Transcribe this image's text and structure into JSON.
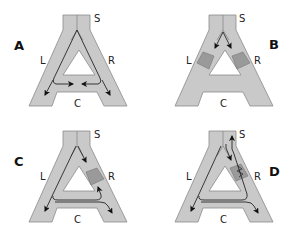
{
  "figure": {
    "colors": {
      "channel_fill": "#c9c9c9",
      "channel_edge": "#8a8a8a",
      "block_fill": "#9a9a9a",
      "arrow": "#111111",
      "background": "#ffffff"
    },
    "panels": [
      {
        "id": "A",
        "label": "A",
        "segment_labels": {
          "stem": "S",
          "left": "L",
          "right": "R",
          "cross": "C"
        },
        "blocks": [],
        "flow": "From S, flow splits into L and R; along C, arrows point inward from both sides meeting at the middle"
      },
      {
        "id": "B",
        "label": "B",
        "segment_labels": {
          "stem": "S",
          "left": "L",
          "right": "R",
          "cross": "C"
        },
        "blocks": [
          "L",
          "R"
        ],
        "flow": "From S, arrows point into L and R which are both blocked"
      },
      {
        "id": "C",
        "label": "C",
        "segment_labels": {
          "stem": "S",
          "left": "L",
          "right": "R",
          "cross": "C"
        },
        "blocks": [
          "R"
        ],
        "flow": "R blocked; flow goes down L, across C, then up R below the block and down the right leg"
      },
      {
        "id": "D",
        "label": "D",
        "segment_labels": {
          "stem": "S",
          "left": "L",
          "right": "R",
          "cross": "C"
        },
        "blocks": [
          "R (partial, zigzag)"
        ],
        "flow": "Partial block in R; flow down L, across C, up R and back up toward S along the right side, plus down the right leg"
      }
    ]
  }
}
